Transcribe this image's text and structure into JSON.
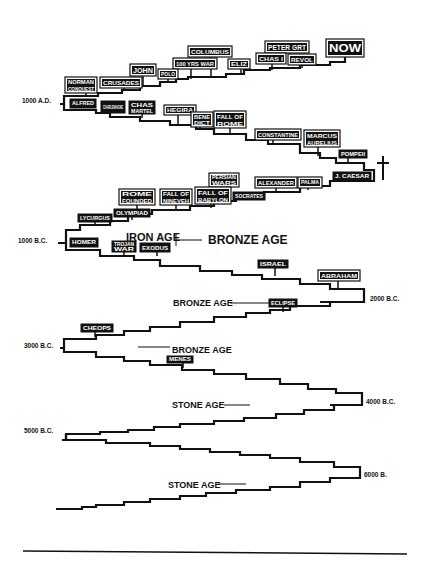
{
  "diagram": {
    "type": "zigzag-timeline",
    "ink": "#111111",
    "background": "#ffffff",
    "date_markers": [
      {
        "text": "1000 A.D.",
        "x": 22,
        "y": 103
      },
      {
        "text": "1000 B.C.",
        "x": 18,
        "y": 243
      },
      {
        "text": "2000 B.C.",
        "x": 370,
        "y": 301
      },
      {
        "text": "3000 B.C.",
        "x": 24,
        "y": 348
      },
      {
        "text": "4000 B.C.",
        "x": 366,
        "y": 404
      },
      {
        "text": "5000 B.C.",
        "x": 24,
        "y": 433
      },
      {
        "text": "6000 B.",
        "x": 364,
        "y": 477
      }
    ],
    "era_labels": [
      {
        "text": "IRON AGE",
        "x": 126,
        "y": 241,
        "size": 11
      },
      {
        "text": "BRONZE AGE",
        "x": 208,
        "y": 244,
        "size": 12
      },
      {
        "text": "BRONZE AGE",
        "x": 173,
        "y": 306,
        "size": 9
      },
      {
        "text": "BRONZE AGE",
        "x": 172,
        "y": 353,
        "size": 9
      },
      {
        "text": "STONE AGE",
        "x": 172,
        "y": 408,
        "size": 9
      },
      {
        "text": "STONE AGE",
        "x": 168,
        "y": 488,
        "size": 9
      }
    ],
    "era_lines": [
      {
        "x1": 176,
        "y1": 240,
        "x2": 202,
        "y2": 240
      },
      {
        "x1": 176,
        "y1": 234,
        "x2": 176,
        "y2": 246
      },
      {
        "x1": 230,
        "y1": 303,
        "x2": 270,
        "y2": 303
      },
      {
        "x1": 138,
        "y1": 347,
        "x2": 170,
        "y2": 347
      },
      {
        "x1": 224,
        "y1": 405,
        "x2": 250,
        "y2": 405
      },
      {
        "x1": 218,
        "y1": 484,
        "x2": 246,
        "y2": 484
      }
    ],
    "events": [
      {
        "text": "NOW",
        "x": 327,
        "y": 40,
        "w": 36,
        "h": 16,
        "size": 11,
        "style": "outline",
        "px": 345,
        "py": 62
      },
      {
        "text": "PETER GRT",
        "x": 266,
        "y": 42,
        "w": 42,
        "h": 10,
        "size": 7,
        "style": "outline",
        "px": 290,
        "py": 65
      },
      {
        "text": "REVOL",
        "x": 289,
        "y": 55,
        "w": 26,
        "h": 9,
        "size": 6,
        "style": "outline",
        "px": 302,
        "py": 68
      },
      {
        "text": "CHAS I",
        "x": 257,
        "y": 54,
        "w": 28,
        "h": 9,
        "size": 6,
        "style": "outline",
        "px": 272,
        "py": 70
      },
      {
        "text": "ELIZ",
        "x": 229,
        "y": 60,
        "w": 20,
        "h": 8,
        "size": 6,
        "style": "outline",
        "px": 241,
        "py": 74
      },
      {
        "text": "COLUMBUS",
        "x": 189,
        "y": 47,
        "w": 42,
        "h": 9,
        "size": 6,
        "style": "outline",
        "px": 211,
        "py": 77
      },
      {
        "text": "100 YRS WAR",
        "x": 174,
        "y": 59,
        "w": 42,
        "h": 9,
        "size": 6,
        "style": "outline",
        "px": 191,
        "py": 79
      },
      {
        "text": "POLO",
        "x": 159,
        "y": 70,
        "w": 18,
        "h": 8,
        "size": 6,
        "style": "outline",
        "px": 168,
        "py": 82
      },
      {
        "text": "JOHN",
        "x": 131,
        "y": 65,
        "w": 24,
        "h": 10,
        "size": 7,
        "style": "outline",
        "px": 143,
        "py": 86
      },
      {
        "text": "CRUSADES",
        "x": 101,
        "y": 78,
        "w": 40,
        "h": 9,
        "size": 6,
        "style": "outline",
        "px": 124,
        "py": 89
      },
      {
        "text": "NORMAN CONQUEST",
        "x": 66,
        "y": 78,
        "w": 30,
        "h": 14,
        "size": 5,
        "style": "outline2",
        "px": 86,
        "py": 95
      },
      {
        "text": "ALFRED",
        "x": 70,
        "y": 99,
        "w": 26,
        "h": 9,
        "size": 5,
        "style": "solid",
        "px": 86,
        "py": 108
      },
      {
        "text": "CHARLEMAGNE",
        "x": 101,
        "y": 101,
        "w": 24,
        "h": 12,
        "size": 5,
        "style": "solid2",
        "px": 112,
        "py": 113
      },
      {
        "text": "CHAS MARTEL",
        "x": 129,
        "y": 101,
        "w": 26,
        "h": 13,
        "size": 5,
        "style": "solid2",
        "px": 142,
        "py": 118
      },
      {
        "text": "HEGIRA",
        "x": 165,
        "y": 106,
        "w": 30,
        "h": 8,
        "size": 6,
        "style": "outline",
        "px": 178,
        "py": 124
      },
      {
        "text": "BENE DICT",
        "x": 192,
        "y": 113,
        "w": 20,
        "h": 13,
        "size": 5,
        "style": "outline2",
        "px": 200,
        "py": 128
      },
      {
        "text": "FALL OF ROME",
        "x": 215,
        "y": 112,
        "w": 30,
        "h": 15,
        "size": 6,
        "style": "outline2",
        "px": 230,
        "py": 134
      },
      {
        "text": "CONSTANTINE",
        "x": 256,
        "y": 130,
        "w": 44,
        "h": 9,
        "size": 6,
        "style": "outline",
        "px": 273,
        "py": 143
      },
      {
        "text": "MARCUS AURELIUS",
        "x": 305,
        "y": 131,
        "w": 34,
        "h": 15,
        "size": 6,
        "style": "outline2",
        "px": 318,
        "py": 156
      },
      {
        "text": "POMPEII",
        "x": 339,
        "y": 150,
        "w": 28,
        "h": 8,
        "size": 5,
        "style": "solid",
        "px": 348,
        "py": 163
      },
      {
        "text": "J. CAESAR",
        "x": 333,
        "y": 172,
        "w": 38,
        "h": 9,
        "size": 5,
        "style": "solid",
        "px": 345,
        "py": 181
      },
      {
        "text": "PERSIAN WARS",
        "x": 210,
        "y": 174,
        "w": 28,
        "h": 12,
        "size": 5,
        "style": "outline2",
        "px": 226,
        "py": 196
      },
      {
        "text": "ALEXANDER",
        "x": 256,
        "y": 178,
        "w": 40,
        "h": 9,
        "size": 6,
        "style": "outline",
        "px": 276,
        "py": 192
      },
      {
        "text": "PALMA",
        "x": 299,
        "y": 178,
        "w": 22,
        "h": 9,
        "size": 5,
        "style": "outline",
        "px": 308,
        "py": 190
      },
      {
        "text": "SOCRATES",
        "x": 233,
        "y": 192,
        "w": 32,
        "h": 8,
        "size": 5,
        "style": "solid",
        "px": 247,
        "py": 200
      },
      {
        "text": "FALL OF BABYLON",
        "x": 196,
        "y": 188,
        "w": 34,
        "h": 15,
        "size": 6,
        "style": "outline2",
        "px": 211,
        "py": 208
      },
      {
        "text": "FALL OF NINEVEH",
        "x": 161,
        "y": 190,
        "w": 30,
        "h": 14,
        "size": 6,
        "style": "outline2",
        "px": 176,
        "py": 210
      },
      {
        "text": "ROME FOUNDED",
        "x": 120,
        "y": 190,
        "w": 34,
        "h": 14,
        "size": 6,
        "style": "outline2",
        "px": 137,
        "py": 214
      },
      {
        "text": "OLYMPIAD",
        "x": 114,
        "y": 209,
        "w": 36,
        "h": 8,
        "size": 5,
        "style": "solid",
        "px": 132,
        "py": 220
      },
      {
        "text": "LYCURGUS",
        "x": 78,
        "y": 214,
        "w": 34,
        "h": 8,
        "size": 5,
        "style": "solid",
        "px": 95,
        "py": 225
      },
      {
        "text": "HOMER",
        "x": 70,
        "y": 238,
        "w": 28,
        "h": 9,
        "size": 5,
        "style": "solid",
        "px": 84,
        "py": 242
      },
      {
        "text": "TROJAN WAR",
        "x": 112,
        "y": 241,
        "w": 24,
        "h": 11,
        "size": 5,
        "style": "solid2",
        "px": 124,
        "py": 255
      },
      {
        "text": "EXODUS",
        "x": 140,
        "y": 243,
        "w": 30,
        "h": 9,
        "size": 6,
        "style": "solid",
        "px": 157,
        "py": 256
      },
      {
        "text": "ISRAEL",
        "x": 258,
        "y": 260,
        "w": 30,
        "h": 8,
        "size": 5,
        "style": "solid",
        "px": 275,
        "py": 276
      },
      {
        "text": "ABRAHAM",
        "x": 319,
        "y": 271,
        "w": 40,
        "h": 9,
        "size": 6,
        "style": "outline",
        "px": 338,
        "py": 289
      },
      {
        "text": "ECLIPSE",
        "x": 269,
        "y": 299,
        "w": 28,
        "h": 8,
        "size": 5,
        "style": "solid",
        "px": 283,
        "py": 312
      },
      {
        "text": "CHEOPS",
        "x": 81,
        "y": 324,
        "w": 32,
        "h": 8,
        "size": 5,
        "style": "solid",
        "px": 95,
        "py": 337
      },
      {
        "text": "MENES",
        "x": 167,
        "y": 356,
        "w": 26,
        "h": 7,
        "size": 5,
        "style": "solid",
        "px": 183,
        "py": 368
      }
    ],
    "cross": {
      "symbol": "cross-icon",
      "x": 383,
      "y": 168
    }
  }
}
